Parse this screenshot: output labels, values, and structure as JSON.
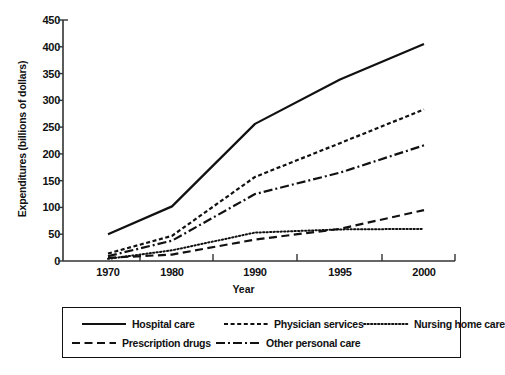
{
  "chart_data": {
    "type": "line",
    "title": "",
    "xlabel": "Year",
    "ylabel": "Expenditures (billions of dollars)",
    "categories": [
      "1970",
      "1980",
      "1990",
      "1995",
      "2000"
    ],
    "x_tick_labels": [
      "1970",
      "1980",
      "1990",
      "1995",
      "2000"
    ],
    "y_tick_labels": [
      "0",
      "50",
      "100",
      "150",
      "200",
      "250",
      "300",
      "350",
      "400",
      "450"
    ],
    "y_ticks": [
      0,
      50,
      100,
      150,
      200,
      250,
      300,
      350,
      400,
      450
    ],
    "ylim": [
      0,
      450
    ],
    "grid": false,
    "legend_position": "below",
    "series": [
      {
        "name": "Hospital care",
        "style": "solid",
        "values": [
          50,
          102,
          256,
          339,
          405
        ]
      },
      {
        "name": "Physician services",
        "style": "short-dash",
        "values": [
          14,
          47,
          157,
          220,
          283
        ]
      },
      {
        "name": "Nursing home care",
        "style": "dotted",
        "values": [
          4,
          20,
          53,
          59,
          60
        ]
      },
      {
        "name": "Prescription drugs",
        "style": "long-dash",
        "values": [
          6,
          12,
          40,
          60,
          95
        ]
      },
      {
        "name": "Other personal care",
        "style": "dash-dot",
        "values": [
          9,
          38,
          125,
          165,
          216
        ]
      }
    ]
  },
  "legend": {
    "items": [
      {
        "label": "Hospital care",
        "style": "solid"
      },
      {
        "label": "Physician services",
        "style": "short-dash"
      },
      {
        "label": "Nursing home care",
        "style": "dotted"
      },
      {
        "label": "Prescription drugs",
        "style": "long-dash"
      },
      {
        "label": "Other personal care",
        "style": "dash-dot"
      }
    ]
  }
}
